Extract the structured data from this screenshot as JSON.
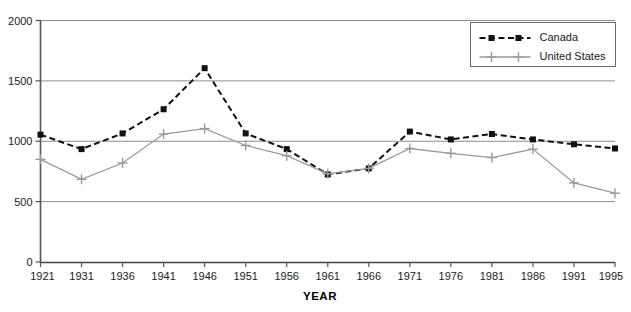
{
  "chart_data": {
    "type": "line",
    "title": "",
    "xlabel": "YEAR",
    "ylabel": "",
    "grid": true,
    "legend_position": "top-right",
    "categories": [
      "1921",
      "1931",
      "1936",
      "1941",
      "1946",
      "1951",
      "1956",
      "1961",
      "1966",
      "1971",
      "1976",
      "1981",
      "1986",
      "1991",
      "1995"
    ],
    "x_tick_labels": [
      "1921",
      "1931",
      "1936",
      "1941",
      "1946",
      "1951",
      "1956",
      "1961",
      "1966",
      "1971",
      "1976",
      "1981",
      "1986",
      "1991",
      "1995"
    ],
    "y_tick_labels": [
      "0",
      "500",
      "1000",
      "1500",
      "2000"
    ],
    "y_ticks": [
      0,
      500,
      1000,
      1500,
      2000
    ],
    "ylim": [
      0,
      2000
    ],
    "series": [
      {
        "name": "Canada",
        "marker": "square",
        "line_style": "dashed",
        "color": "#111111",
        "values": [
          1055,
          935,
          1065,
          1265,
          1605,
          1065,
          935,
          725,
          775,
          1080,
          1015,
          1060,
          1015,
          975,
          940
        ]
      },
      {
        "name": "United States",
        "marker": "plus",
        "line_style": "solid",
        "color": "#9a9a9a",
        "values": [
          850,
          685,
          820,
          1060,
          1105,
          965,
          880,
          730,
          775,
          940,
          900,
          865,
          935,
          655,
          570
        ]
      }
    ],
    "legend": [
      {
        "label": "Canada",
        "marker": "square",
        "line_style": "dashed",
        "color": "#111111"
      },
      {
        "label": "United States",
        "marker": "plus",
        "line_style": "solid",
        "color": "#9a9a9a"
      }
    ]
  }
}
